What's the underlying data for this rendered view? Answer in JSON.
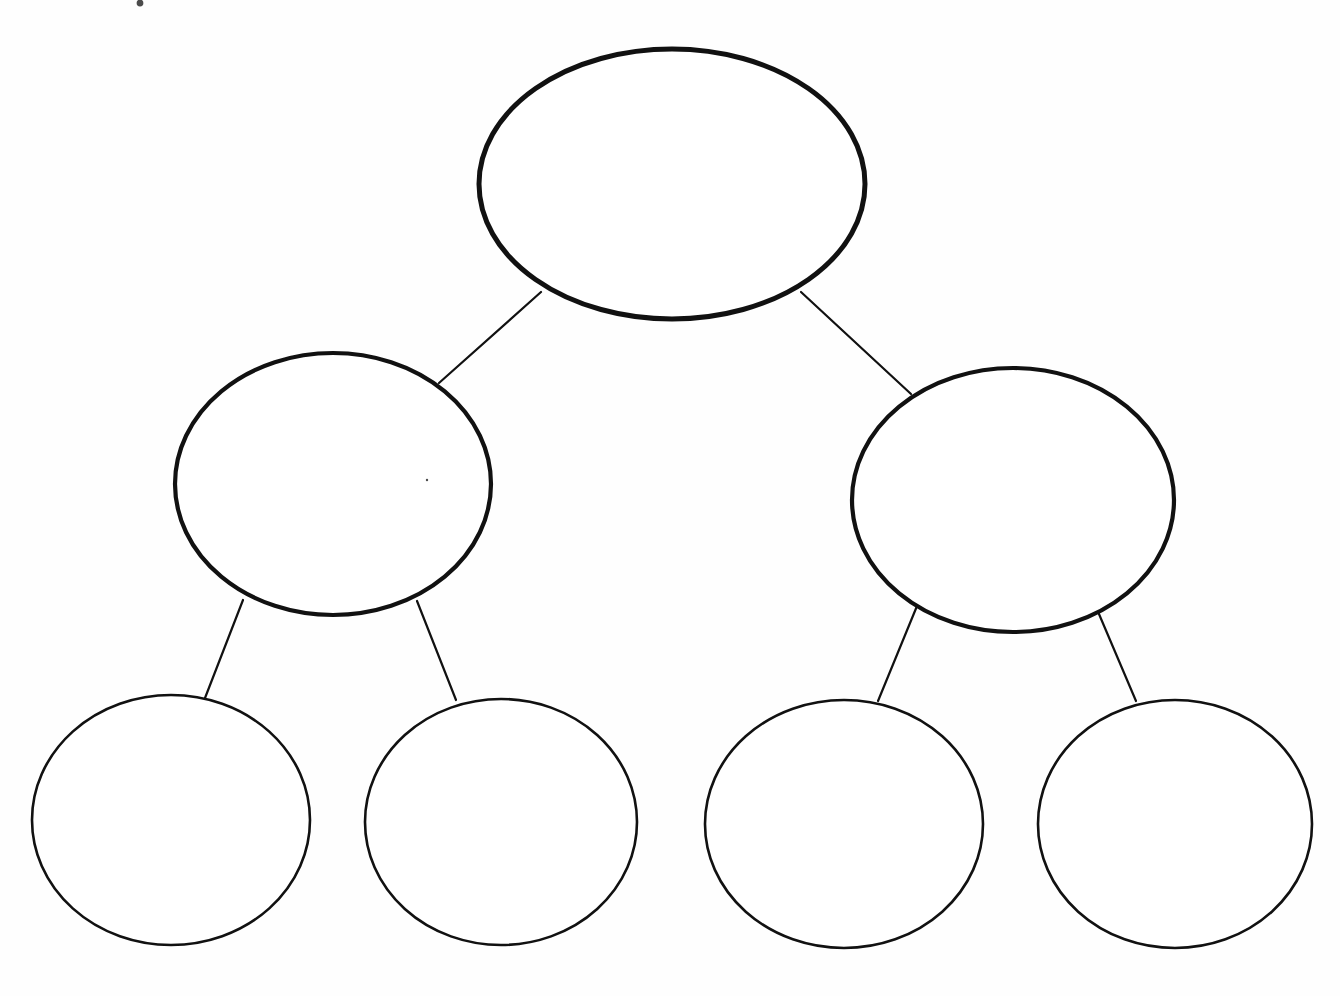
{
  "document": {
    "title": "Blank hierarchy / tree graphic organizer",
    "type": "diagram",
    "background_color": "#fefefe",
    "width": 1340,
    "height": 996
  },
  "style": {
    "ink_color": "#111111",
    "fill_color": "#ffffff",
    "thick_stroke_width": 5,
    "medium_stroke_width": 4,
    "thin_stroke_width": 2.6,
    "edge_stroke_width": 2.2
  },
  "diagram": {
    "kind": "tree",
    "levels": 3,
    "node_count": 7,
    "edge_count": 6,
    "nodes": [
      {
        "id": "root",
        "level": 0,
        "shape": "ellipse",
        "label": "",
        "cx": 672,
        "cy": 184,
        "rx": 193,
        "ry": 135,
        "stroke_width": 5
      },
      {
        "id": "branch-left",
        "level": 1,
        "shape": "ellipse",
        "label": "",
        "cx": 333,
        "cy": 484,
        "rx": 158,
        "ry": 131,
        "stroke_width": 4.2
      },
      {
        "id": "branch-right",
        "level": 1,
        "shape": "ellipse",
        "label": "",
        "cx": 1013,
        "cy": 500,
        "rx": 161,
        "ry": 132,
        "stroke_width": 4.2
      },
      {
        "id": "leaf-1",
        "level": 2,
        "shape": "circle",
        "label": "",
        "cx": 171,
        "cy": 820,
        "rx": 139,
        "ry": 125,
        "stroke_width": 2.6
      },
      {
        "id": "leaf-2",
        "level": 2,
        "shape": "circle",
        "label": "",
        "cx": 501,
        "cy": 822,
        "rx": 136,
        "ry": 123,
        "stroke_width": 2.6
      },
      {
        "id": "leaf-3",
        "level": 2,
        "shape": "circle",
        "label": "",
        "cx": 844,
        "cy": 824,
        "rx": 139,
        "ry": 124,
        "stroke_width": 2.6
      },
      {
        "id": "leaf-4",
        "level": 2,
        "shape": "circle",
        "label": "",
        "cx": 1175,
        "cy": 824,
        "rx": 137,
        "ry": 124,
        "stroke_width": 2.6
      }
    ],
    "edges": [
      {
        "id": "edge-root-left",
        "from": "root",
        "to": "branch-left",
        "x1": 541,
        "y1": 292,
        "x2": 439,
        "y2": 383
      },
      {
        "id": "edge-root-right",
        "from": "root",
        "to": "branch-right",
        "x1": 801,
        "y1": 292,
        "x2": 911,
        "y2": 394
      },
      {
        "id": "edge-left-leaf1",
        "from": "branch-left",
        "to": "leaf-1",
        "x1": 243,
        "y1": 600,
        "x2": 205,
        "y2": 698
      },
      {
        "id": "edge-left-leaf2",
        "from": "branch-left",
        "to": "leaf-2",
        "x1": 417,
        "y1": 601,
        "x2": 456,
        "y2": 700
      },
      {
        "id": "edge-right-leaf3",
        "from": "branch-right",
        "to": "leaf-3",
        "x1": 917,
        "y1": 606,
        "x2": 878,
        "y2": 701
      },
      {
        "id": "edge-right-leaf4",
        "from": "branch-right",
        "to": "leaf-4",
        "x1": 1096,
        "y1": 607,
        "x2": 1136,
        "y2": 701
      }
    ],
    "specks": [
      {
        "id": "speck-top",
        "cx": 140,
        "cy": 3,
        "r": 3.4
      },
      {
        "id": "speck-inner",
        "cx": 427,
        "cy": 480,
        "r": 1.2
      }
    ]
  }
}
